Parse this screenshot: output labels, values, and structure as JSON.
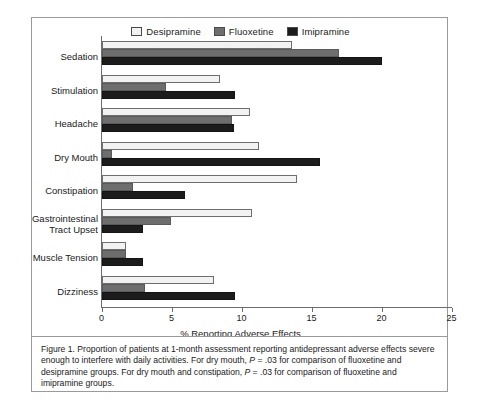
{
  "figure": {
    "caption": "Figure 1. Proportion of patients at 1-month assessment reporting antidepressant adverse effects severe enough to interfere with daily activities. For dry mouth, P = .03 for comparison of fluoxetine and desipramine groups. For dry mouth and constipation, P = .03 for comparison of fluoxetine and imipramine groups."
  },
  "colors": {
    "desipramine": "#f2f2f2",
    "fluoxetine": "#6e6e6e",
    "imipramine": "#1c1c1c",
    "axis": "#6d6d6d",
    "frame": "#9a9a9a"
  },
  "legend": {
    "position": "top-center",
    "entries": [
      {
        "label": "Desipramine",
        "swatch": "legend-swatch-desipramine"
      },
      {
        "label": "Fluoxetine",
        "swatch": "legend-swatch-fluoxetine"
      },
      {
        "label": "Imipramine",
        "swatch": "legend-swatch-imipramine"
      }
    ]
  },
  "chart_data": {
    "type": "bar",
    "orientation": "horizontal",
    "title": "",
    "xlabel": "% Reporting Adverse Effects",
    "ylabel": "",
    "xlim": [
      0,
      25
    ],
    "xticks": [
      0,
      5,
      10,
      15,
      20,
      25
    ],
    "xtick_labels": [
      "0",
      "5",
      "10",
      "15",
      "20",
      "25"
    ],
    "grid": false,
    "categories": [
      "Sedation",
      "Stimulation",
      "Headache",
      "Dry Mouth",
      "Constipation",
      "Gastrointestinal\nTract Upset",
      "Muscle Tension",
      "Dizziness"
    ],
    "series": [
      {
        "name": "Desipramine",
        "color": "#f2f2f2",
        "values": [
          13.6,
          8.4,
          10.6,
          11.2,
          13.9,
          10.7,
          1.7,
          8.0
        ]
      },
      {
        "name": "Fluoxetine",
        "color": "#6e6e6e",
        "values": [
          16.9,
          4.6,
          9.3,
          0.7,
          2.2,
          4.9,
          1.7,
          3.1
        ]
      },
      {
        "name": "Imipramine",
        "color": "#1c1c1c",
        "values": [
          20.0,
          9.5,
          9.4,
          15.6,
          5.9,
          2.9,
          2.9,
          9.5
        ]
      }
    ],
    "annotations": [
      "For dry mouth, P = .03 for comparison of fluoxetine and desipramine groups.",
      "For dry mouth and constipation, P = .03 for comparison of fluoxetine and imipramine groups."
    ]
  }
}
